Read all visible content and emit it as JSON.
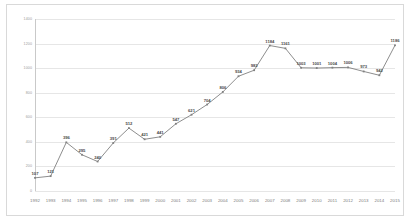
{
  "chart_data": {
    "type": "line",
    "title": "",
    "subtitle": "",
    "xlabel": "",
    "ylabel": "",
    "grid": true,
    "legend": false,
    "marker": "square",
    "line_color": "#808080",
    "marker_color": "#808080",
    "data_labels": true,
    "ylim": [
      0,
      1400
    ],
    "ytick_values": [
      0,
      200,
      400,
      600,
      800,
      1000,
      1200,
      1400
    ],
    "ytick_labels": [
      "0",
      "200",
      "400",
      "600",
      "800",
      "1000",
      "1200",
      "1400"
    ],
    "categories": [
      "1992",
      "1993",
      "1994",
      "1995",
      "1996",
      "1997",
      "1998",
      "1999",
      "2000",
      "2001",
      "2002",
      "2003",
      "2004",
      "2005",
      "2006",
      "2007",
      "2008",
      "2009",
      "2010",
      "2011",
      "2012",
      "2013",
      "2014",
      "2015"
    ],
    "values": [
      107,
      121,
      396,
      295,
      240,
      391,
      512,
      421,
      441,
      547,
      621,
      704,
      806,
      934,
      983,
      1184,
      1161,
      1003,
      1001,
      1004,
      1006,
      973,
      942,
      1186
    ],
    "point_labels": [
      "107",
      "121",
      "396",
      "295",
      "240",
      "391",
      "512",
      "421",
      "441",
      "547",
      "621",
      "704",
      "806",
      "934",
      "983",
      "1184",
      "1161",
      "1003",
      "1001",
      "1004",
      "1006",
      "973",
      "942",
      "1186"
    ]
  },
  "colors": {
    "border": "#d9d9d9",
    "gridline": "#e6e6e6",
    "axis": "#c9c9c9",
    "tick_text": "#9a9a9a",
    "label_text": "#4a4a4a",
    "series": "#808080",
    "background": "#ffffff"
  }
}
